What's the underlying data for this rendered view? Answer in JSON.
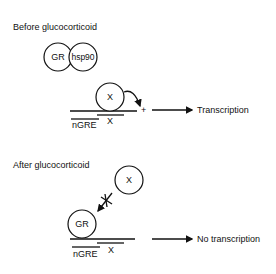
{
  "panels": {
    "before": {
      "title": "Before glucocorticoid",
      "gr_label": "GR",
      "hsp90_label": "hsp90",
      "x_protein_label": "X",
      "x_site_label": "X",
      "ngre_label": "nGRE",
      "plus_sign": "+",
      "outcome": "Transcription"
    },
    "after": {
      "title": "After glucocorticoid",
      "x_protein_label": "X",
      "gr_label": "GR",
      "x_site_label": "X",
      "ngre_label": "nGRE",
      "outcome": "No transcription"
    }
  }
}
